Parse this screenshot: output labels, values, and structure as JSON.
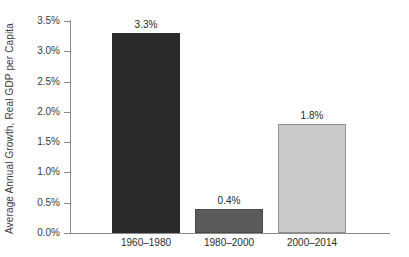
{
  "chart_data": {
    "type": "bar",
    "title": "",
    "xlabel": "",
    "ylabel": "Average Annual Growth, Real GDP per Capita",
    "categories": [
      "1960–1980",
      "1980–2000",
      "2000–2014"
    ],
    "values": [
      3.3,
      0.4,
      1.8
    ],
    "value_labels": [
      "3.3%",
      "0.4%",
      "1.8%"
    ],
    "ylim": [
      0.0,
      3.5
    ],
    "ytick_values": [
      0.0,
      0.5,
      1.0,
      1.5,
      2.0,
      2.5,
      3.0,
      3.5
    ],
    "ytick_labels": [
      "0.0%",
      "0.5%",
      "1.0%",
      "1.5%",
      "2.0%",
      "2.5%",
      "3.0%",
      "3.5%"
    ],
    "grid": false,
    "legend": null,
    "bar_colors": [
      "#2b2b2b",
      "#5b5b5b",
      "#cacaca"
    ],
    "axis_color": "#8a8a8a",
    "text_color": "#2a2a2a",
    "background": "#ffffff"
  }
}
